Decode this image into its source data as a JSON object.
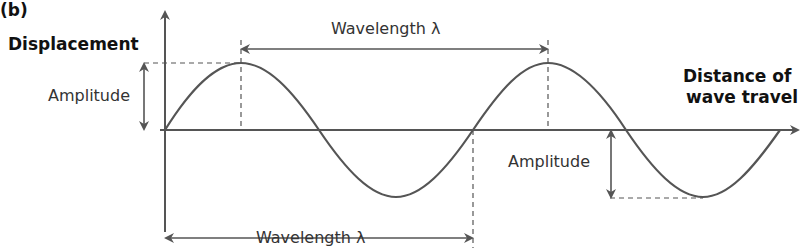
{
  "panel_label": "(b)",
  "axes": {
    "y_label": "Displacement",
    "x_label_line1": "Distance of",
    "x_label_line2": "wave travel"
  },
  "annotations": {
    "amplitude_top": "Amplitude",
    "amplitude_bottom": "Amplitude",
    "wavelength_top": "Wavelength λ",
    "wavelength_bottom": "Wavelength λ"
  },
  "colors": {
    "line": "#555555",
    "text": "#333333"
  }
}
